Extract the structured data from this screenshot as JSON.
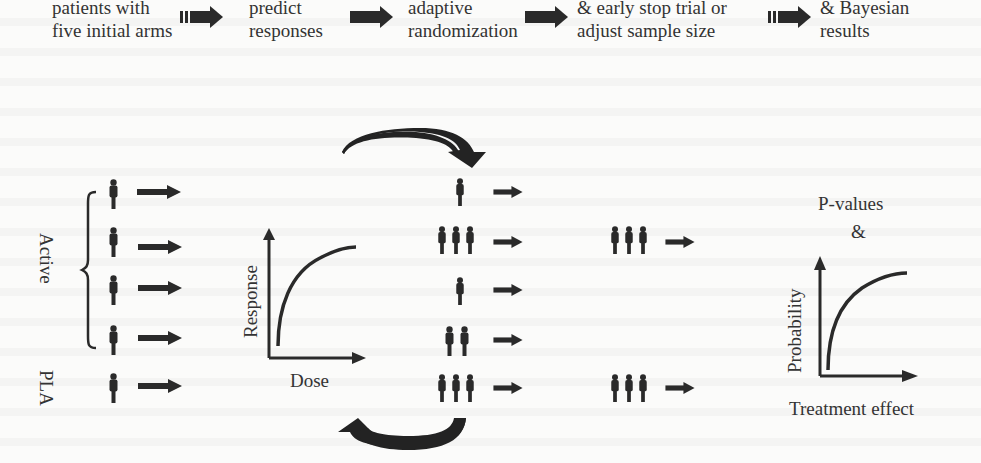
{
  "process_steps": [
    {
      "line1": "patients with",
      "line2": "five initial arms"
    },
    {
      "line1": "predict",
      "line2": "responses"
    },
    {
      "line1": "adaptive",
      "line2": "randomization"
    },
    {
      "line1": "& early stop trial or",
      "line2": "adjust sample size"
    },
    {
      "line1": "& Bayesian",
      "line2": "results"
    }
  ],
  "left_group": {
    "bracket_label": "Active",
    "placebo_label": "PLA",
    "arms": [
      {
        "group": "Active",
        "people": 1
      },
      {
        "group": "Active",
        "people": 1
      },
      {
        "group": "Active",
        "people": 1
      },
      {
        "group": "Active",
        "people": 1
      },
      {
        "group": "PLA",
        "people": 1
      }
    ]
  },
  "dose_response_plot": {
    "ylabel": "Response",
    "xlabel": "Dose"
  },
  "adaptive_arms": [
    {
      "people": 1
    },
    {
      "people": 3
    },
    {
      "people": 1
    },
    {
      "people": 2
    },
    {
      "people": 3
    }
  ],
  "selected_arms": [
    {
      "people": 3
    },
    {
      "people": 3
    }
  ],
  "result_plot": {
    "title_line1": "P-values",
    "title_line2": "&",
    "ylabel": "Probability",
    "xlabel": "Treatment effect"
  },
  "colors": {
    "ink": "#2a2a2a",
    "background": "#fbfbfa"
  }
}
